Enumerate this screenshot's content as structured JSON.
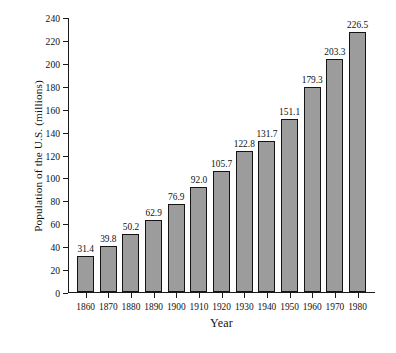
{
  "chart_data": {
    "type": "bar",
    "title": "",
    "xlabel": "Year",
    "ylabel": "Population of the U.S. (millions)",
    "categories": [
      "1860",
      "1870",
      "1880",
      "1890",
      "1900",
      "1910",
      "1920",
      "1930",
      "1940",
      "1950",
      "1960",
      "1970",
      "1980"
    ],
    "values": [
      31.4,
      39.8,
      50.2,
      62.9,
      76.9,
      92.0,
      105.7,
      122.8,
      131.7,
      151.1,
      179.3,
      203.3,
      226.5
    ],
    "value_labels": [
      "31.4",
      "39.8",
      "50.2",
      "62.9",
      "76.9",
      "92.0",
      "105.7",
      "122.8",
      "131.7",
      "151.1",
      "179.3",
      "203.3",
      "226.5"
    ],
    "ylim": [
      0,
      240
    ],
    "ytick_values": [
      0,
      20,
      40,
      60,
      80,
      100,
      120,
      140,
      160,
      180,
      200,
      220,
      240
    ],
    "ytick_labels": [
      "0",
      "20",
      "40",
      "60",
      "80",
      "100",
      "120",
      "140",
      "160",
      "180",
      "200",
      "220",
      "240"
    ],
    "grid": false,
    "legend": null,
    "bar_color": "#9c9c9c",
    "bar_edge_color": "#141414",
    "axis_color": "#1a1a1a",
    "background": "#ffffff"
  }
}
